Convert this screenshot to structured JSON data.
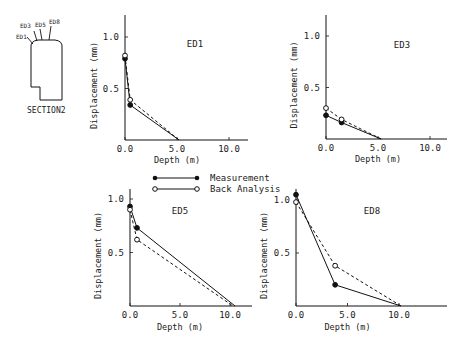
{
  "figure": {
    "section_label": "SECTION2",
    "extensometer_labels": [
      "ED1",
      "ED3",
      "ED5",
      "ED8"
    ]
  },
  "legend": {
    "items": [
      {
        "label": "Measurement",
        "marker": "filled-circle",
        "line": "solid"
      },
      {
        "label": "Back Analysis",
        "marker": "open-circle",
        "line": "dashed"
      }
    ]
  },
  "chart_data": [
    {
      "type": "line",
      "title": "ED1",
      "xlabel": "Depth (m)",
      "ylabel": "Displacement (mm)",
      "xlim": [
        0,
        12
      ],
      "ylim": [
        0,
        1.2
      ],
      "xticks": [
        "0.0",
        "5.0",
        "10.0"
      ],
      "yticks": [
        "0.5",
        "1.0"
      ],
      "series": [
        {
          "name": "Measurement",
          "x": [
            0,
            0.5,
            5.2
          ],
          "y": [
            0.79,
            0.34,
            0
          ]
        },
        {
          "name": "Back Analysis",
          "x": [
            0,
            0.5,
            5.2
          ],
          "y": [
            0.82,
            0.39,
            0
          ]
        }
      ]
    },
    {
      "type": "line",
      "title": "ED3",
      "xlabel": "Depth (m)",
      "ylabel": "Displacement (mm)",
      "xlim": [
        0,
        12
      ],
      "ylim": [
        0,
        1.2
      ],
      "xticks": [
        "0.0",
        "5.0",
        "10.0"
      ],
      "yticks": [
        "0.5",
        "1.0"
      ],
      "series": [
        {
          "name": "Measurement",
          "x": [
            0,
            1.5,
            5.3
          ],
          "y": [
            0.23,
            0.16,
            0
          ]
        },
        {
          "name": "Back Analysis",
          "x": [
            0,
            1.5,
            5.3
          ],
          "y": [
            0.3,
            0.19,
            0
          ]
        }
      ]
    },
    {
      "type": "line",
      "title": "ED5",
      "xlabel": "Depth (m)",
      "ylabel": "Displacement (mm)",
      "xlim": [
        0,
        12
      ],
      "ylim": [
        0,
        1.0
      ],
      "xticks": [
        "0.0",
        "5.0",
        "10.0"
      ],
      "yticks": [
        "0.5",
        "1.0"
      ],
      "series": [
        {
          "name": "Measurement",
          "x": [
            0,
            0.7,
            10.5
          ],
          "y": [
            0.93,
            0.73,
            0
          ]
        },
        {
          "name": "Back Analysis",
          "x": [
            0,
            0.7,
            10.3
          ],
          "y": [
            0.9,
            0.62,
            0
          ]
        }
      ]
    },
    {
      "type": "line",
      "title": "ED8",
      "xlabel": "Depth (m)",
      "ylabel": "Displacement (mm)",
      "xlim": [
        0,
        12
      ],
      "ylim": [
        0,
        1.0
      ],
      "xticks": [
        "0.0",
        "5.0",
        "10.0"
      ],
      "yticks": [
        "0.5",
        "1.0"
      ],
      "series": [
        {
          "name": "Measurement",
          "x": [
            0,
            3.8,
            10.2
          ],
          "y": [
            1.05,
            0.2,
            0
          ]
        },
        {
          "name": "Back Analysis",
          "x": [
            0,
            3.8,
            10.2
          ],
          "y": [
            0.98,
            0.38,
            0
          ]
        }
      ]
    }
  ]
}
